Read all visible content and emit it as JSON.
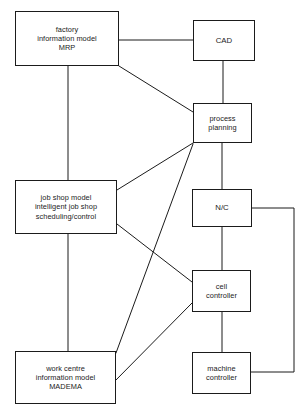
{
  "diagram": {
    "canvas": {
      "width": 304,
      "height": 411
    },
    "style": {
      "background": "#ffffff",
      "box_stroke": "#1b1b1b",
      "line_stroke": "#1b1b1b",
      "text_color": "#1b1b1b"
    },
    "nodes": [
      {
        "id": "factory-information-model",
        "label": "factory\ninformation model\nMRP",
        "x": 15,
        "y": 11,
        "w": 104,
        "h": 55
      },
      {
        "id": "cad",
        "label": "CAD",
        "x": 193,
        "y": 20,
        "w": 62,
        "h": 41
      },
      {
        "id": "process-planning",
        "label": "process\nplanning",
        "x": 193,
        "y": 103,
        "w": 59,
        "h": 40
      },
      {
        "id": "job-shop-model",
        "label": "job shop model\nintelligent job shop\nscheduling/control",
        "x": 15,
        "y": 180,
        "w": 102,
        "h": 54
      },
      {
        "id": "nc",
        "label": "N/C",
        "x": 192,
        "y": 189,
        "w": 60,
        "h": 38
      },
      {
        "id": "cell-controller",
        "label": "cell\ncontroller",
        "x": 192,
        "y": 270,
        "w": 59,
        "h": 42
      },
      {
        "id": "work-centre-information-model",
        "label": "work centre\ninformation model\nMADEMA",
        "x": 15,
        "y": 351,
        "w": 101,
        "h": 53
      },
      {
        "id": "machine-controller",
        "label": "machine\ncontroller",
        "x": 192,
        "y": 352,
        "w": 59,
        "h": 42
      }
    ],
    "connectors": [
      {
        "id": "factory-to-cad",
        "from": "factory-information-model",
        "to": "cad",
        "path": "M 119 40 L 193 40"
      },
      {
        "id": "factory-to-process-planning",
        "from": "factory-information-model",
        "to": "process-planning",
        "path": "M 119 66 L 193 112"
      },
      {
        "id": "factory-to-job-shop",
        "from": "factory-information-model",
        "to": "job-shop-model",
        "path": "M 68 66 L 68 180"
      },
      {
        "id": "cad-to-process-planning",
        "from": "cad",
        "to": "process-planning",
        "path": "M 223 61 L 223 103"
      },
      {
        "id": "job-shop-to-process-planning",
        "from": "job-shop-model",
        "to": "process-planning",
        "path": "M 117 190 L 193 143"
      },
      {
        "id": "process-planning-to-nc",
        "from": "process-planning",
        "to": "nc",
        "path": "M 222 143 L 222 189"
      },
      {
        "id": "process-planning-to-work-centre",
        "from": "process-planning",
        "to": "work-centre-information-model",
        "path": "M 193 144 L 116 353"
      },
      {
        "id": "job-shop-to-cell-controller",
        "from": "job-shop-model",
        "to": "cell-controller",
        "path": "M 117 224 L 192 282"
      },
      {
        "id": "job-shop-to-work-centre",
        "from": "job-shop-model",
        "to": "work-centre-information-model",
        "path": "M 68 234 L 68 351"
      },
      {
        "id": "nc-to-cell-controller",
        "from": "nc",
        "to": "cell-controller",
        "path": "M 222 227 L 222 270"
      },
      {
        "id": "nc-to-machine-controller-bypass",
        "from": "nc",
        "to": "machine-controller",
        "path": "M 252 208 L 294 208 L 294 372 L 251 372"
      },
      {
        "id": "cell-controller-to-machine-controller",
        "from": "cell-controller",
        "to": "machine-controller",
        "path": "M 222 312 L 222 352"
      },
      {
        "id": "cell-controller-to-work-centre",
        "from": "cell-controller",
        "to": "work-centre-information-model",
        "path": "M 192 303 L 116 380"
      }
    ]
  }
}
